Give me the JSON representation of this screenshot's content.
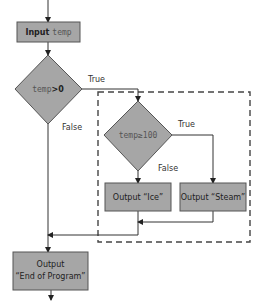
{
  "diagram": {
    "type": "flowchart",
    "colors": {
      "shape_fill": "#a6a6a6",
      "shape_stroke": "#555555",
      "line": "#333333",
      "dashed_group": "#444444"
    },
    "nodes": {
      "input": {
        "kind": "process",
        "keyword": "Input",
        "variable": "temp"
      },
      "decision1": {
        "kind": "decision",
        "variable": "temp",
        "operator": ">0"
      },
      "decision2": {
        "kind": "decision",
        "text": "temp≥100"
      },
      "output_ice": {
        "kind": "process",
        "text": "Output “Ice”"
      },
      "output_steam": {
        "kind": "process",
        "text": "Output “Steam”"
      },
      "output_end": {
        "kind": "process",
        "line1": "Output",
        "line2": "“End of Program”"
      }
    },
    "edges": {
      "d1_true": "True",
      "d1_false": "False",
      "d2_true": "True",
      "d2_false": "False"
    }
  }
}
